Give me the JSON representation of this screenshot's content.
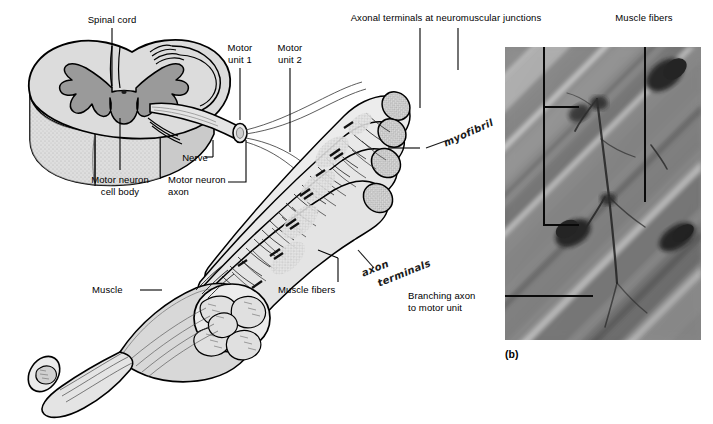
{
  "figure": {
    "panel_label": "(b)"
  },
  "labels": {
    "spinal_cord": "Spinal cord",
    "motor_neuron_cell_body": "Motor neuron\ncell body",
    "nerve": "Nerve",
    "motor_neuron_axon": "Motor neuron\naxon",
    "motor_unit_1": "Motor\nunit 1",
    "motor_unit_2": "Motor\nunit 2",
    "axonal_terminals": "Axonal terminals at neuromuscular junctions",
    "muscle_fibers_top": "Muscle fibers",
    "muscle": "Muscle",
    "muscle_fibers_bottom": "Muscle fibers",
    "branching_axon": "Branching axon\nto motor unit"
  },
  "handwritten": {
    "myofibril": "myofibril",
    "axon": "axon",
    "terminals": "terminals"
  },
  "colors": {
    "background": "#ffffff",
    "ink": "#000000",
    "gray_matter": "#9a9a9a",
    "white_matter": "#dcdcdc",
    "fiber_fill": "#e8e8e8",
    "photo_base": "#8d8d8d"
  }
}
